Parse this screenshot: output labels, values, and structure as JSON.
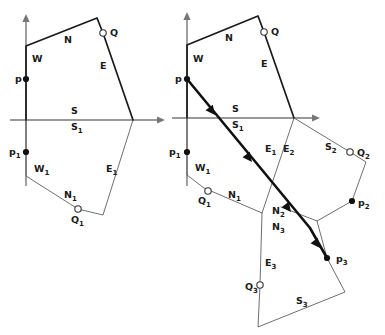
{
  "figure": {
    "background_color": "#ffffff",
    "ink_color": "#1a1a1a",
    "axis_color": "#777777",
    "width": 385,
    "height": 335
  },
  "panels": [
    {
      "id": "left",
      "name": "left-diagram",
      "origin": {
        "x": 26,
        "y": 120
      },
      "axes": {
        "vertical": {
          "x": 26,
          "y_top": 14,
          "y_bottom": 186,
          "arrow": "up"
        },
        "horizontal": {
          "y": 120,
          "x_left": 10,
          "x_right": 165,
          "arrow": "right"
        }
      },
      "polygons": [
        {
          "name": "upper-cell",
          "style": "thick",
          "vertices": [
            {
              "x": 26,
              "y": 120
            },
            {
              "x": 26,
              "y": 46
            },
            {
              "x": 97,
              "y": 18
            },
            {
              "x": 103,
              "y": 33
            },
            {
              "x": 133,
              "y": 120
            }
          ]
        },
        {
          "name": "lower-cell",
          "style": "thin",
          "vertices": [
            {
              "x": 26,
              "y": 120
            },
            {
              "x": 26,
              "y": 176
            },
            {
              "x": 78,
              "y": 209
            },
            {
              "x": 103,
              "y": 215
            },
            {
              "x": 133,
              "y": 120
            }
          ]
        }
      ],
      "points": [
        {
          "name": "p",
          "kind": "filled",
          "x": 26,
          "y": 79,
          "label": "p",
          "sub": "",
          "label_x": 15,
          "label_y": 82
        },
        {
          "name": "p1",
          "kind": "filled",
          "x": 26,
          "y": 152,
          "label": "p",
          "sub": "1",
          "label_x": 9,
          "label_y": 155
        },
        {
          "name": "Q",
          "kind": "hollow",
          "x": 103,
          "y": 33,
          "label": "Q",
          "sub": "",
          "label_x": 110,
          "label_y": 36
        },
        {
          "name": "Q1",
          "kind": "hollow",
          "x": 78,
          "y": 209,
          "label": "Q",
          "sub": "1",
          "label_x": 71,
          "label_y": 223
        }
      ],
      "edge_labels": [
        {
          "name": "label-N",
          "text": "N",
          "sub": "",
          "x": 64,
          "y": 43
        },
        {
          "name": "label-W",
          "text": "W",
          "sub": "",
          "x": 32,
          "y": 62
        },
        {
          "name": "label-E",
          "text": "E",
          "sub": "",
          "x": 100,
          "y": 69
        },
        {
          "name": "label-S",
          "text": "S",
          "sub": "",
          "x": 71,
          "y": 114
        },
        {
          "name": "label-S1",
          "text": "S",
          "sub": "1",
          "x": 71,
          "y": 130
        },
        {
          "name": "label-W1",
          "text": "W",
          "sub": "1",
          "x": 34,
          "y": 172
        },
        {
          "name": "label-N1",
          "text": "N",
          "sub": "1",
          "x": 64,
          "y": 198
        },
        {
          "name": "label-E1",
          "text": "E",
          "sub": "1",
          "x": 106,
          "y": 172
        }
      ]
    },
    {
      "id": "right",
      "name": "right-diagram",
      "origin": {
        "x": 187,
        "y": 118
      },
      "axes": {
        "vertical": {
          "x": 187,
          "y_top": 12,
          "y_bottom": 186,
          "arrow": "up"
        },
        "horizontal": {
          "y": 118,
          "x_left": 172,
          "x_right": 320,
          "arrow": "right"
        }
      },
      "polygons": [
        {
          "name": "upper-cell",
          "style": "thick",
          "vertices": [
            {
              "x": 187,
              "y": 118
            },
            {
              "x": 187,
              "y": 45
            },
            {
              "x": 258,
              "y": 16
            },
            {
              "x": 264,
              "y": 32
            },
            {
              "x": 294,
              "y": 118
            }
          ]
        },
        {
          "name": "cell-1",
          "style": "thin",
          "vertices": [
            {
              "x": 187,
              "y": 118
            },
            {
              "x": 187,
              "y": 175
            },
            {
              "x": 204,
              "y": 188
            },
            {
              "x": 262,
              "y": 213
            },
            {
              "x": 294,
              "y": 118
            }
          ]
        },
        {
          "name": "cell-2",
          "style": "thin",
          "vertices": [
            {
              "x": 294,
              "y": 118
            },
            {
              "x": 350,
              "y": 152
            },
            {
              "x": 366,
              "y": 162
            },
            {
              "x": 352,
              "y": 201
            },
            {
              "x": 317,
              "y": 221
            },
            {
              "x": 281,
              "y": 207
            }
          ]
        },
        {
          "name": "cell-3",
          "style": "thin",
          "vertices": [
            {
              "x": 262,
              "y": 213
            },
            {
              "x": 260,
              "y": 285
            },
            {
              "x": 258,
              "y": 327
            },
            {
              "x": 345,
              "y": 292
            },
            {
              "x": 327,
              "y": 258
            },
            {
              "x": 317,
              "y": 221
            }
          ]
        }
      ],
      "ray": {
        "name": "query-ray",
        "start": {
          "x": 187,
          "y": 79
        },
        "end": {
          "x": 327,
          "y": 258
        },
        "waypoint": {
          "x": 310,
          "y": 228
        },
        "arrowheads": [
          {
            "x": 215,
            "y": 115
          },
          {
            "x": 252,
            "y": 162
          },
          {
            "x": 291,
            "y": 212
          },
          {
            "x": 320,
            "y": 248
          }
        ]
      },
      "points": [
        {
          "name": "p",
          "kind": "filled",
          "x": 187,
          "y": 79,
          "label": "p",
          "sub": "",
          "label_x": 175,
          "label_y": 82
        },
        {
          "name": "p1",
          "kind": "filled",
          "x": 187,
          "y": 152,
          "label": "p",
          "sub": "1",
          "label_x": 169,
          "label_y": 155
        },
        {
          "name": "p2",
          "kind": "filled",
          "x": 352,
          "y": 201,
          "label": "p",
          "sub": "2",
          "label_x": 358,
          "label_y": 206
        },
        {
          "name": "p3",
          "kind": "filled",
          "x": 327,
          "y": 258,
          "label": "p",
          "sub": "3",
          "label_x": 336,
          "label_y": 262
        },
        {
          "name": "Q",
          "kind": "hollow",
          "x": 264,
          "y": 32,
          "label": "Q",
          "sub": "",
          "label_x": 271,
          "label_y": 35
        },
        {
          "name": "Q1",
          "kind": "hollow",
          "x": 208,
          "y": 191,
          "label": "Q",
          "sub": "1",
          "label_x": 198,
          "label_y": 204
        },
        {
          "name": "Q2",
          "kind": "hollow",
          "x": 350,
          "y": 152,
          "label": "Q",
          "sub": "2",
          "label_x": 357,
          "label_y": 156
        },
        {
          "name": "Q3",
          "kind": "hollow",
          "x": 260,
          "y": 285,
          "label": "Q",
          "sub": "3",
          "label_x": 245,
          "label_y": 290
        }
      ],
      "edge_labels": [
        {
          "name": "label-N",
          "text": "N",
          "sub": "",
          "x": 225,
          "y": 41
        },
        {
          "name": "label-W",
          "text": "W",
          "sub": "",
          "x": 193,
          "y": 62
        },
        {
          "name": "label-E",
          "text": "E",
          "sub": "",
          "x": 261,
          "y": 67
        },
        {
          "name": "label-S",
          "text": "S",
          "sub": "",
          "x": 232,
          "y": 112
        },
        {
          "name": "label-S1",
          "text": "S",
          "sub": "1",
          "x": 232,
          "y": 128
        },
        {
          "name": "label-W1",
          "text": "W",
          "sub": "1",
          "x": 195,
          "y": 171
        },
        {
          "name": "label-N1",
          "text": "N",
          "sub": "1",
          "x": 228,
          "y": 198
        },
        {
          "name": "label-E1",
          "text": "E",
          "sub": "1",
          "x": 265,
          "y": 152
        },
        {
          "name": "label-E2",
          "text": "E",
          "sub": "2",
          "x": 283,
          "y": 152
        },
        {
          "name": "label-S2",
          "text": "S",
          "sub": "2",
          "x": 325,
          "y": 150
        },
        {
          "name": "label-N2",
          "text": "N",
          "sub": "2",
          "x": 272,
          "y": 214
        },
        {
          "name": "label-N3",
          "text": "N",
          "sub": "3",
          "x": 272,
          "y": 230
        },
        {
          "name": "label-E3",
          "text": "E",
          "sub": "3",
          "x": 265,
          "y": 266
        },
        {
          "name": "label-S3",
          "text": "S",
          "sub": "3",
          "x": 296,
          "y": 304
        }
      ]
    }
  ]
}
